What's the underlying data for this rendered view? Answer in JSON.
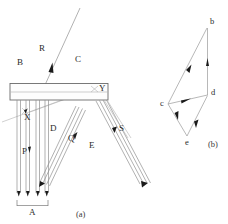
{
  "figure": {
    "caption_a": "(a)",
    "caption_b": "(b)",
    "panel_a": {
      "labels": {
        "B": "B",
        "C": "C",
        "R": "R",
        "Y": "Y",
        "X": "X",
        "D": "D",
        "E": "E",
        "P": "P",
        "Q": "Q",
        "S": "S",
        "A": "A"
      }
    },
    "panel_b": {
      "labels": {
        "b": "b",
        "c": "c",
        "d": "d",
        "e": "e"
      }
    }
  },
  "colors": {
    "background": "#ffffff",
    "line": "#8f8f8f",
    "line_dark": "#555555",
    "text": "#2b2b2b",
    "arrowhead": "#1a1a1a"
  }
}
